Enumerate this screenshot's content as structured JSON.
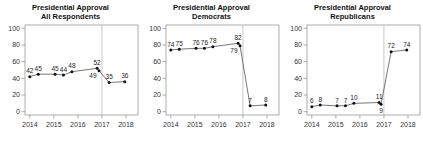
{
  "colors": {
    "background": "#ffffff",
    "axis": "#999999",
    "ref_line": "#bdbdbd",
    "line": "#555555",
    "dot": "#111111",
    "point_label": "#222222",
    "tick_label": "#333333",
    "title": "#111111"
  },
  "chart_data": [
    {
      "type": "line",
      "title_line1": "Presidential Approval",
      "title_line2": "All Respondents",
      "series_name": "All Respondents",
      "xlabel": "",
      "ylabel": "",
      "x_ticks": [
        "2014",
        "2015",
        "2016",
        "2017",
        "2018"
      ],
      "y_ticks": [
        0,
        20,
        40,
        60,
        80,
        100
      ],
      "xlim": [
        2013.8,
        2018.5
      ],
      "ylim": [
        0,
        100
      ],
      "grid": false,
      "legend": "none",
      "ref_line_x": 2017,
      "points": [
        {
          "x": 2014.0,
          "y": 42,
          "label": "42",
          "lp": "a"
        },
        {
          "x": 2014.35,
          "y": 45,
          "label": "45",
          "lp": "a"
        },
        {
          "x": 2015.05,
          "y": 45,
          "label": "45",
          "lp": "a"
        },
        {
          "x": 2015.4,
          "y": 44,
          "label": "44",
          "lp": "a"
        },
        {
          "x": 2015.75,
          "y": 48,
          "label": "48",
          "lp": "a"
        },
        {
          "x": 2016.8,
          "y": 52,
          "label": "52",
          "lp": "a"
        },
        {
          "x": 2016.88,
          "y": 49,
          "label": "49",
          "lp": "bl"
        },
        {
          "x": 2017.3,
          "y": 35,
          "label": "35",
          "lp": "a"
        },
        {
          "x": 2017.95,
          "y": 36,
          "label": "36",
          "lp": "a"
        }
      ]
    },
    {
      "type": "line",
      "title_line1": "Presidential Approval",
      "title_line2": "Democrats",
      "series_name": "Democrats",
      "xlabel": "",
      "ylabel": "",
      "x_ticks": [
        "2014",
        "2015",
        "2016",
        "2017",
        "2018"
      ],
      "y_ticks": [
        0,
        20,
        40,
        60,
        80,
        100
      ],
      "xlim": [
        2013.8,
        2018.5
      ],
      "ylim": [
        0,
        100
      ],
      "grid": false,
      "legend": "none",
      "ref_line_x": 2017,
      "points": [
        {
          "x": 2014.0,
          "y": 74,
          "label": "74",
          "lp": "a"
        },
        {
          "x": 2014.35,
          "y": 75,
          "label": "75",
          "lp": "a"
        },
        {
          "x": 2015.05,
          "y": 76,
          "label": "76",
          "lp": "a"
        },
        {
          "x": 2015.4,
          "y": 76,
          "label": "76",
          "lp": "a"
        },
        {
          "x": 2015.75,
          "y": 78,
          "label": "78",
          "lp": "a"
        },
        {
          "x": 2016.8,
          "y": 82,
          "label": "82",
          "lp": "a"
        },
        {
          "x": 2016.88,
          "y": 79,
          "label": "79",
          "lp": "bl"
        },
        {
          "x": 2017.3,
          "y": 7,
          "label": "7",
          "lp": "a"
        },
        {
          "x": 2017.95,
          "y": 8,
          "label": "8",
          "lp": "a"
        }
      ]
    },
    {
      "type": "line",
      "title_line1": "Presidential Approval",
      "title_line2": "Republicans",
      "series_name": "Republicans",
      "xlabel": "",
      "ylabel": "",
      "x_ticks": [
        "2014",
        "2015",
        "2016",
        "2017",
        "2018"
      ],
      "y_ticks": [
        0,
        20,
        40,
        60,
        80,
        100
      ],
      "xlim": [
        2013.8,
        2018.5
      ],
      "ylim": [
        0,
        100
      ],
      "grid": false,
      "legend": "none",
      "ref_line_x": 2017,
      "points": [
        {
          "x": 2014.0,
          "y": 6,
          "label": "6",
          "lp": "a"
        },
        {
          "x": 2014.35,
          "y": 8,
          "label": "8",
          "lp": "a"
        },
        {
          "x": 2015.05,
          "y": 7,
          "label": "7",
          "lp": "a"
        },
        {
          "x": 2015.4,
          "y": 7,
          "label": "7",
          "lp": "a"
        },
        {
          "x": 2015.75,
          "y": 10,
          "label": "10",
          "lp": "a"
        },
        {
          "x": 2016.8,
          "y": 11,
          "label": "11",
          "lp": "a"
        },
        {
          "x": 2016.88,
          "y": 9,
          "label": "9",
          "lp": "b"
        },
        {
          "x": 2017.3,
          "y": 72,
          "label": "72",
          "lp": "a"
        },
        {
          "x": 2017.95,
          "y": 74,
          "label": "74",
          "lp": "a"
        }
      ]
    }
  ]
}
